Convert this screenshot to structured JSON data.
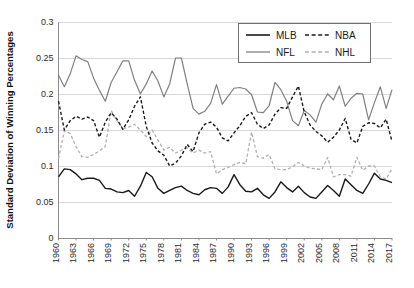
{
  "chart_data": {
    "type": "line",
    "title": "",
    "xlabel": "",
    "ylabel": "Standard Deviation of Winning Percentages",
    "ylim": [
      0,
      0.3
    ],
    "xlim": [
      1960,
      2017
    ],
    "grid": true,
    "legend_position": "top-right",
    "ytick_labels": [
      "0",
      "0.05",
      "0.1",
      "0.15",
      "0.2",
      "0.25",
      "0.3"
    ],
    "ytick_values": [
      0,
      0.05,
      0.1,
      0.15,
      0.2,
      0.25,
      0.3
    ],
    "xtick_labels": [
      "1960",
      "1963",
      "1966",
      "1969",
      "1972",
      "1975",
      "1978",
      "1981",
      "1984",
      "1987",
      "1990",
      "1993",
      "1996",
      "1999",
      "2002",
      "2005",
      "2008",
      "2011",
      "2014",
      "2017"
    ],
    "xtick_values": [
      1960,
      1963,
      1966,
      1969,
      1972,
      1975,
      1978,
      1981,
      1984,
      1987,
      1990,
      1993,
      1996,
      1999,
      2002,
      2005,
      2008,
      2011,
      2014,
      2017
    ],
    "x": [
      1960,
      1961,
      1962,
      1963,
      1964,
      1965,
      1966,
      1967,
      1968,
      1969,
      1970,
      1971,
      1972,
      1973,
      1974,
      1975,
      1976,
      1977,
      1978,
      1979,
      1980,
      1981,
      1982,
      1983,
      1984,
      1985,
      1986,
      1987,
      1988,
      1989,
      1990,
      1991,
      1992,
      1993,
      1994,
      1995,
      1996,
      1997,
      1998,
      1999,
      2000,
      2001,
      2002,
      2003,
      2004,
      2005,
      2006,
      2007,
      2008,
      2009,
      2010,
      2011,
      2012,
      2013,
      2014,
      2015,
      2016,
      2017
    ],
    "series": [
      {
        "name": "MLB",
        "color": "#1a1a1a",
        "style": "solid",
        "width": 1.4,
        "values": [
          0.085,
          0.096,
          0.095,
          0.089,
          0.081,
          0.083,
          0.083,
          0.08,
          0.069,
          0.068,
          0.064,
          0.063,
          0.066,
          0.058,
          0.072,
          0.091,
          0.085,
          0.069,
          0.062,
          0.066,
          0.07,
          0.072,
          0.066,
          0.062,
          0.06,
          0.067,
          0.07,
          0.069,
          0.062,
          0.071,
          0.088,
          0.074,
          0.065,
          0.064,
          0.069,
          0.06,
          0.055,
          0.064,
          0.078,
          0.07,
          0.064,
          0.072,
          0.063,
          0.057,
          0.055,
          0.064,
          0.073,
          0.066,
          0.058,
          0.082,
          0.074,
          0.066,
          0.062,
          0.075,
          0.09,
          0.082,
          0.08,
          0.077
        ]
      },
      {
        "name": "NFL",
        "color": "#808080",
        "style": "solid",
        "width": 1.2,
        "values": [
          0.226,
          0.21,
          0.228,
          0.253,
          0.248,
          0.245,
          0.222,
          0.205,
          0.19,
          0.216,
          0.231,
          0.246,
          0.246,
          0.219,
          0.2,
          0.214,
          0.232,
          0.218,
          0.196,
          0.214,
          0.25,
          0.25,
          0.214,
          0.18,
          0.172,
          0.176,
          0.187,
          0.213,
          0.186,
          0.197,
          0.208,
          0.209,
          0.207,
          0.199,
          0.175,
          0.174,
          0.184,
          0.216,
          0.206,
          0.19,
          0.163,
          0.156,
          0.177,
          0.171,
          0.161,
          0.186,
          0.2,
          0.192,
          0.211,
          0.183,
          0.194,
          0.201,
          0.2,
          0.164,
          0.188,
          0.21,
          0.18,
          0.206
        ]
      },
      {
        "name": "NBA",
        "color": "#1a1a1a",
        "style": "dashed",
        "width": 1.4,
        "values": [
          0.19,
          0.15,
          0.163,
          0.169,
          0.165,
          0.168,
          0.163,
          0.14,
          0.161,
          0.174,
          0.165,
          0.151,
          0.164,
          0.183,
          0.196,
          0.155,
          0.132,
          0.121,
          0.115,
          0.1,
          0.104,
          0.114,
          0.13,
          0.12,
          0.146,
          0.158,
          0.161,
          0.154,
          0.139,
          0.135,
          0.146,
          0.156,
          0.169,
          0.174,
          0.158,
          0.152,
          0.157,
          0.172,
          0.181,
          0.18,
          0.196,
          0.211,
          0.175,
          0.157,
          0.148,
          0.142,
          0.133,
          0.14,
          0.15,
          0.166,
          0.137,
          0.132,
          0.155,
          0.16,
          0.159,
          0.153,
          0.165,
          0.134
        ]
      },
      {
        "name": "NHL",
        "color": "#b0b0b0",
        "style": "dashed",
        "width": 1.3,
        "values": [
          0.11,
          0.149,
          0.145,
          0.127,
          0.113,
          0.112,
          0.116,
          0.121,
          0.127,
          0.177,
          0.163,
          0.152,
          0.154,
          0.158,
          0.15,
          0.141,
          0.15,
          0.136,
          0.122,
          0.126,
          0.118,
          0.122,
          0.125,
          0.118,
          0.122,
          0.118,
          0.12,
          0.089,
          0.095,
          0.098,
          0.102,
          0.105,
          0.103,
          0.147,
          0.113,
          0.111,
          0.116,
          0.096,
          0.095,
          0.095,
          0.099,
          0.105,
          0.1,
          0.097,
          0.096,
          0.095,
          0.112,
          0.085,
          0.088,
          0.088,
          0.086,
          0.112,
          0.094,
          0.1,
          0.1,
          0.085,
          0.082,
          0.096
        ]
      }
    ]
  },
  "legend": {
    "entries": [
      {
        "label": "MLB",
        "key": "mlb"
      },
      {
        "label": "NBA",
        "key": "nba"
      },
      {
        "label": "NFL",
        "key": "nfl"
      },
      {
        "label": "NHL",
        "key": "nhl"
      }
    ]
  },
  "colors": {
    "mlb": "#1a1a1a",
    "nfl": "#808080",
    "nba": "#1a1a1a",
    "nhl": "#b0b0b0",
    "gridline": "#d9d9d9",
    "axis": "#8c8c8c",
    "background": "#ffffff"
  }
}
